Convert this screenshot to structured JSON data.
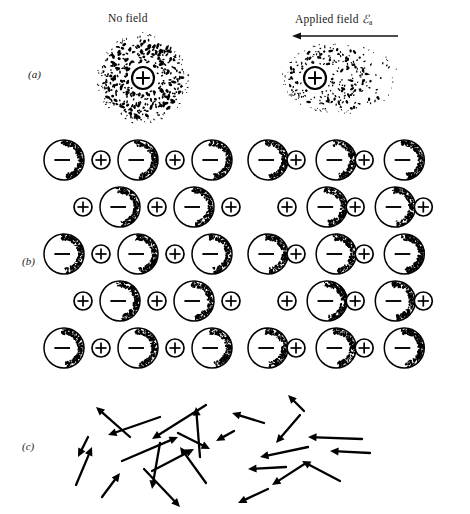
{
  "figure": {
    "caption_columns": {
      "no_field": "No field",
      "applied_field_prefix": "Applied field",
      "applied_field_symbol": "ℰ",
      "applied_field_subscript": "a"
    },
    "field_arrow": {
      "name": "applied-field-arrow",
      "direction": "left",
      "x1": 110,
      "y1": 10,
      "x2": 4,
      "y2": 10
    },
    "panels": [
      {
        "id": "a",
        "label": "(a)",
        "mechanism": "electronic polarization",
        "no_field": {
          "cloud_shape": "circle",
          "cloud_cx": 143,
          "cloud_cy": 48,
          "cloud_r": 46,
          "nucleus_cx": 143,
          "nucleus_cy": 48,
          "nucleus_r": 11,
          "nucleus_symbol": "plus",
          "stipple_count": 520,
          "stipple_bias_x": 0
        },
        "applied_field": {
          "cloud_shape": "ellipse",
          "cloud_cx": 340,
          "cloud_cy": 48,
          "cloud_rx": 58,
          "cloud_ry": 36,
          "nucleus_cx": 315,
          "nucleus_cy": 48,
          "nucleus_r": 11,
          "nucleus_symbol": "plus",
          "stipple_count": 520,
          "stipple_bias_x": -0.35
        }
      },
      {
        "id": "b",
        "label": "(b)",
        "mechanism": "ionic polarization",
        "ion_large_symbol": "minus",
        "ion_small_symbol": "plus",
        "ion_large_r": 20,
        "ion_small_r": 9,
        "row_spacing": 47,
        "row_count": 5,
        "no_field": {
          "x_origin": 44,
          "unit_pitch": 60,
          "anion_gap": 0,
          "row_offsets": [
            0,
            30,
            0,
            30,
            0
          ],
          "rows": [
            [
              "minus",
              "plus",
              "minus",
              "plus",
              "minus"
            ],
            [
              "plus",
              "minus",
              "plus",
              "minus",
              "plus"
            ],
            [
              "minus",
              "plus",
              "minus",
              "plus",
              "minus"
            ],
            [
              "plus",
              "minus",
              "plus",
              "minus",
              "plus"
            ],
            [
              "minus",
              "plus",
              "minus",
              "plus",
              "minus"
            ]
          ]
        },
        "applied_field": {
          "x_origin": 248,
          "unit_pitch": 62,
          "anion_gap": -9,
          "row_offsets": [
            0,
            30,
            0,
            30,
            0
          ],
          "rows": [
            [
              "minus",
              "plus",
              "minus",
              "plus",
              "minus"
            ],
            [
              "plus",
              "minus",
              "plus",
              "minus",
              "plus"
            ],
            [
              "minus",
              "plus",
              "minus",
              "plus",
              "minus"
            ],
            [
              "plus",
              "minus",
              "plus",
              "minus",
              "plus"
            ],
            [
              "minus",
              "plus",
              "minus",
              "plus",
              "minus"
            ]
          ]
        }
      },
      {
        "id": "c",
        "label": "(c)",
        "mechanism": "orientation polarization",
        "no_field": {
          "description": "randomly oriented dipoles",
          "arrows": [
            {
              "x1": 130,
              "y1": 52,
              "x2": 96,
              "y2": 22
            },
            {
              "x1": 200,
              "y1": 72,
              "x2": 196,
              "y2": 22
            },
            {
              "x1": 160,
              "y1": 32,
              "x2": 108,
              "y2": 50
            },
            {
              "x1": 206,
              "y1": 20,
              "x2": 152,
              "y2": 54
            },
            {
              "x1": 88,
              "y1": 52,
              "x2": 78,
              "y2": 72
            },
            {
              "x1": 76,
              "y1": 100,
              "x2": 92,
              "y2": 62
            },
            {
              "x1": 102,
              "y1": 112,
              "x2": 120,
              "y2": 88
            },
            {
              "x1": 160,
              "y1": 58,
              "x2": 152,
              "y2": 104
            },
            {
              "x1": 122,
              "y1": 76,
              "x2": 178,
              "y2": 52
            },
            {
              "x1": 178,
              "y1": 48,
              "x2": 210,
              "y2": 64
            },
            {
              "x1": 152,
              "y1": 86,
              "x2": 194,
              "y2": 64
            },
            {
              "x1": 206,
              "y1": 98,
              "x2": 180,
              "y2": 62
            },
            {
              "x1": 144,
              "y1": 84,
              "x2": 180,
              "y2": 122
            }
          ]
        },
        "applied_field": {
          "description": "dipoles aligned with field (pointing left)",
          "arrows": [
            {
              "x1": 264,
              "y1": 38,
              "x2": 232,
              "y2": 28
            },
            {
              "x1": 304,
              "y1": 26,
              "x2": 288,
              "y2": 10
            },
            {
              "x1": 300,
              "y1": 30,
              "x2": 276,
              "y2": 58
            },
            {
              "x1": 362,
              "y1": 54,
              "x2": 308,
              "y2": 52
            },
            {
              "x1": 370,
              "y1": 68,
              "x2": 330,
              "y2": 66
            },
            {
              "x1": 308,
              "y1": 62,
              "x2": 260,
              "y2": 72
            },
            {
              "x1": 286,
              "y1": 82,
              "x2": 248,
              "y2": 84
            },
            {
              "x1": 306,
              "y1": 78,
              "x2": 272,
              "y2": 100
            },
            {
              "x1": 340,
              "y1": 96,
              "x2": 302,
              "y2": 76
            },
            {
              "x1": 268,
              "y1": 104,
              "x2": 238,
              "y2": 118
            },
            {
              "x1": 234,
              "y1": 46,
              "x2": 216,
              "y2": 56
            }
          ]
        }
      }
    ]
  }
}
